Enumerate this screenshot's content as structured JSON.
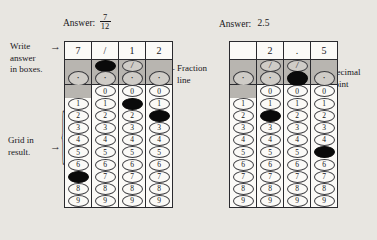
{
  "answers": {
    "grid1": {
      "label": "Answer:",
      "type": "fraction",
      "numerator": "7",
      "denominator": "12"
    },
    "grid2": {
      "label": "Answer:",
      "type": "decimal",
      "value": "2.5"
    }
  },
  "annotations": {
    "write_in_boxes": "Write\nanswer\nin boxes.",
    "write_in_boxes_lines": [
      "Write",
      "answer",
      "in boxes."
    ],
    "grid_in_result_lines": [
      "Grid in",
      "result."
    ],
    "fraction_line_lines": [
      "Fraction",
      "line"
    ],
    "decimal_point_lines": [
      "Decimal",
      "point"
    ],
    "arrow_glyph": "→",
    "arrow_glyph_left": "←",
    "brace_glyph": "{"
  },
  "bubble_labels": {
    "slash": "/",
    "dot": "·",
    "digits": [
      "0",
      "1",
      "2",
      "3",
      "4",
      "5",
      "6",
      "7",
      "8",
      "9"
    ]
  },
  "colors": {
    "page_background": "#e8e6e1",
    "grid_background": "#fbfaf7",
    "shade_band": "#b8b5b0",
    "ink": "#17161a",
    "filled_bubble": "#0a0a0a"
  },
  "grids": [
    {
      "name": "fraction-grid",
      "written": [
        "7",
        "/",
        "1",
        "2"
      ],
      "columns": [
        {
          "slash": "none",
          "dot": "open",
          "zero": "none",
          "digits_marked": "7"
        },
        {
          "slash": "filled",
          "dot": "open",
          "zero": "open",
          "digits_marked": null
        },
        {
          "slash": "open",
          "dot": "open",
          "zero": "open",
          "digits_marked": "1"
        },
        {
          "slash": "none",
          "dot": "open",
          "zero": "open",
          "digits_marked": "2"
        }
      ]
    },
    {
      "name": "decimal-grid",
      "written": [
        "",
        "2",
        ".",
        "5"
      ],
      "columns": [
        {
          "slash": "none",
          "dot": "open",
          "zero": "none",
          "digits_marked": null
        },
        {
          "slash": "open",
          "dot": "open",
          "zero": "open",
          "digits_marked": "2"
        },
        {
          "slash": "open",
          "dot": "filled",
          "zero": "open",
          "digits_marked": null
        },
        {
          "slash": "none",
          "dot": "open",
          "zero": "open",
          "digits_marked": "5"
        }
      ]
    }
  ]
}
